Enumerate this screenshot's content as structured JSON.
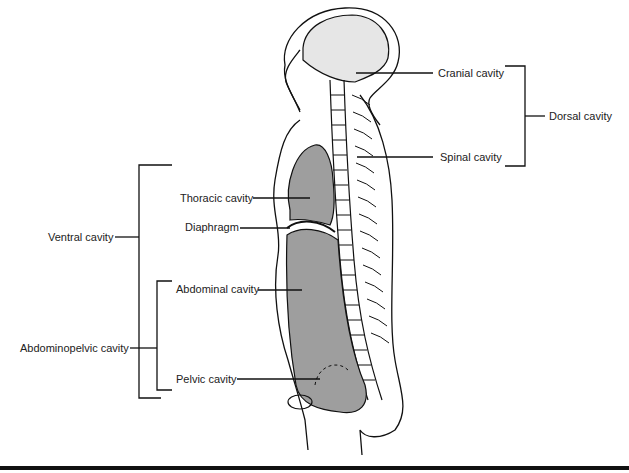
{
  "diagram": {
    "labels": {
      "cranial": "Cranial cavity",
      "spinal": "Spinal cavity",
      "dorsal": "Dorsal cavity",
      "thoracic": "Thoracic cavity",
      "diaphragm": "Diaphragm",
      "ventral": "Ventral cavity",
      "abdominal": "Abdominal cavity",
      "abdominopelvic": "Abdominopelvic cavity",
      "pelvic": "Pelvic cavity"
    },
    "colors": {
      "cavity_fill": "#9e9e9e",
      "cranial_fill": "#e6e6e6",
      "outline": "#111111"
    }
  }
}
